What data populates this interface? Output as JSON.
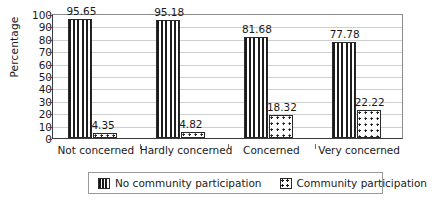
{
  "chart_data": {
    "type": "bar",
    "title": "",
    "xlabel": "",
    "ylabel": "Percentage",
    "ylim": [
      0,
      100
    ],
    "ytick_step": 10,
    "yticks": [
      "100",
      "90",
      "80",
      "70",
      "60",
      "50",
      "40",
      "30",
      "20",
      "10",
      "0"
    ],
    "grid": true,
    "legend_position": "bottom",
    "categories": [
      "Not concerned",
      "Hardly concerned",
      "Concerned",
      "Very concerned"
    ],
    "series": [
      {
        "name": "No community participation",
        "pattern": "vertical-stripes",
        "color": "#1c1c1c",
        "values": [
          95.65,
          95.18,
          81.68,
          77.78
        ],
        "labels": [
          "95.65",
          "95.18",
          "81.68",
          "77.78"
        ]
      },
      {
        "name": "Community participation",
        "pattern": "dots",
        "color": "#1c1c1c",
        "values": [
          4.35,
          4.82,
          18.32,
          22.22
        ],
        "labels": [
          "4.35",
          "4.82",
          "18.32",
          "22.22"
        ]
      }
    ]
  },
  "axis": {
    "y_title": "Percentage"
  },
  "legend": {
    "items": [
      {
        "label": "No community participation"
      },
      {
        "label": "Community participation"
      }
    ]
  }
}
